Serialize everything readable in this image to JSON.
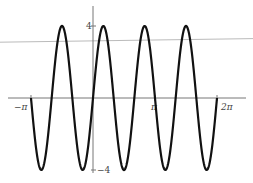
{
  "chart_data": {
    "type": "line",
    "title": "",
    "xlabel": "",
    "ylabel": "",
    "function": "4 sin(3x)",
    "xlim": [
      -3.1416,
      6.2832
    ],
    "ylim": [
      -4,
      4
    ],
    "grid": false,
    "series": [
      {
        "name": "y = 4 sin(3x)",
        "color": "#111111",
        "amplitude": 4,
        "frequency": 3,
        "x_start": -3.1416,
        "x_end": 6.2832
      },
      {
        "name": "reference-line",
        "color": "#bbbbbb",
        "points": [
          [
            -3.6,
            3.1
          ],
          [
            7.1,
            3.3
          ]
        ]
      }
    ],
    "x_ticks": [
      {
        "value": -3.1416,
        "label": "−π"
      },
      {
        "value": 3.1416,
        "label": "π"
      },
      {
        "value": 6.2832,
        "label": "2π"
      }
    ],
    "y_ticks": [
      {
        "value": 4,
        "label": "4"
      },
      {
        "value": -4,
        "label": "−4"
      }
    ],
    "axis_color": "#777777"
  }
}
